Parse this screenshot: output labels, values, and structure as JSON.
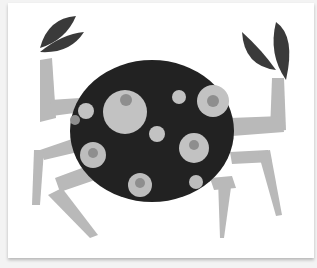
{
  "image": {
    "subject": "paper collage crab",
    "colors": {
      "background": "#f3f3f3",
      "card": "#ffffff",
      "shell": "#222222",
      "claw": "#3a3a3a",
      "leg": "#b8b8b8",
      "spot": "#bdbdbd",
      "spot_ring": "#8a8a8a"
    }
  }
}
